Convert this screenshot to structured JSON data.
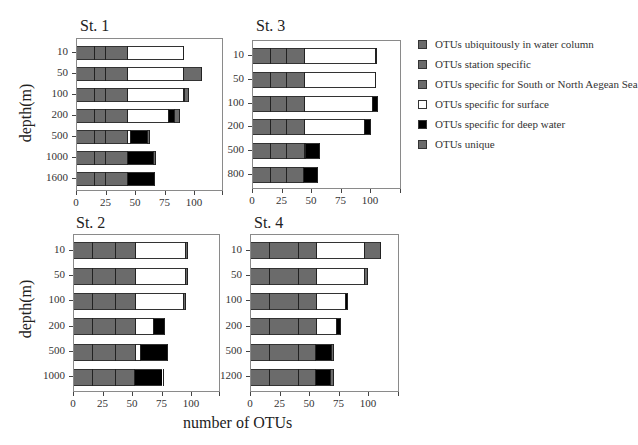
{
  "chart_data": {
    "type": "bar",
    "orientation": "horizontal",
    "stacked": true,
    "xlabel": "number of OTUs",
    "ylabel": "depth(m)",
    "xticks": [
      0,
      25,
      50,
      75,
      100
    ],
    "xlim": [
      0,
      125
    ],
    "legend_position": "right",
    "legend": [
      {
        "key": "ubiq",
        "label": "OTUs ubiquitously in water column",
        "color": "#6b6b6b"
      },
      {
        "key": "stn",
        "label": "OTUs station specific",
        "color": "#6b6b6b"
      },
      {
        "key": "sn",
        "label": "OTUs specific for South or North Aegean Sea",
        "color": "#6b6b6b"
      },
      {
        "key": "surface",
        "label": "OTUs specific for surface",
        "color": "#ffffff"
      },
      {
        "key": "deep",
        "label": "OTUs specific for deep water",
        "color": "#000000"
      },
      {
        "key": "unique",
        "label": "OTUs unique",
        "color": "#6b6b6b"
      }
    ],
    "panels": [
      {
        "title": "St. 1",
        "categories": [
          "10",
          "50",
          "100",
          "200",
          "500",
          "1000",
          "1600"
        ],
        "series": [
          {
            "name": "OTUs ubiquitously in water column",
            "values": [
              14,
              14,
              14,
              14,
              14,
              14,
              14
            ]
          },
          {
            "name": "OTUs station specific",
            "values": [
              10,
              10,
              10,
              10,
              10,
              10,
              10
            ]
          },
          {
            "name": "OTUs specific for South or North Aegean Sea",
            "values": [
              18,
              18,
              18,
              18,
              18,
              18,
              18
            ]
          },
          {
            "name": "OTUs specific for surface",
            "values": [
              48,
              48,
              48,
              35,
              3,
              0,
              0
            ]
          },
          {
            "name": "OTUs specific for deep water",
            "values": [
              0,
              0,
              1,
              5,
              14,
              22,
              23
            ]
          },
          {
            "name": "OTUs unique",
            "values": [
              1,
              16,
              4,
              5,
              3,
              3,
              1
            ]
          }
        ]
      },
      {
        "title": "St. 3",
        "categories": [
          "10",
          "50",
          "100",
          "200",
          "500",
          "800"
        ],
        "series": [
          {
            "name": "OTUs ubiquitously in water column",
            "values": [
              14,
              14,
              14,
              14,
              14,
              14
            ]
          },
          {
            "name": "OTUs station specific",
            "values": [
              14,
              14,
              14,
              14,
              14,
              14
            ]
          },
          {
            "name": "OTUs specific for South or North Aegean Sea",
            "values": [
              15,
              15,
              15,
              15,
              15,
              14
            ]
          },
          {
            "name": "OTUs specific for surface",
            "values": [
              60,
              60,
              58,
              51,
              1,
              0
            ]
          },
          {
            "name": "OTUs specific for deep water",
            "values": [
              0,
              0,
              5,
              5,
              13,
              13
            ]
          },
          {
            "name": "OTUs unique",
            "values": [
              2,
              1,
              0,
              1,
              0,
              0
            ]
          }
        ]
      },
      {
        "title": "St. 2",
        "categories": [
          "10",
          "50",
          "100",
          "200",
          "500",
          "1000"
        ],
        "series": [
          {
            "name": "OTUs ubiquitously in water column",
            "values": [
              15,
              15,
              15,
              15,
              15,
              15
            ]
          },
          {
            "name": "OTUs station specific",
            "values": [
              20,
              20,
              20,
              20,
              20,
              20
            ]
          },
          {
            "name": "OTUs specific for South or North Aegean Sea",
            "values": [
              17,
              17,
              17,
              17,
              17,
              16
            ]
          },
          {
            "name": "OTUs specific for surface",
            "values": [
              42,
              42,
              40,
              15,
              4,
              0
            ]
          },
          {
            "name": "OTUs specific for deep water",
            "values": [
              0,
              0,
              0,
              9,
              23,
              24
            ]
          },
          {
            "name": "OTUs unique",
            "values": [
              3,
              3,
              3,
              1,
              1,
              1
            ]
          }
        ]
      },
      {
        "title": "St. 4",
        "categories": [
          "10",
          "50",
          "100",
          "200",
          "500",
          "1200"
        ],
        "series": [
          {
            "name": "OTUs ubiquitously in water column",
            "values": [
              15,
              15,
              15,
              15,
              15,
              15
            ]
          },
          {
            "name": "OTUs station specific",
            "values": [
              25,
              25,
              25,
              25,
              25,
              25
            ]
          },
          {
            "name": "OTUs specific for South or North Aegean Sea",
            "values": [
              15,
              15,
              15,
              15,
              14,
              14
            ]
          },
          {
            "name": "OTUs specific for surface",
            "values": [
              41,
              41,
              25,
              17,
              0,
              0
            ]
          },
          {
            "name": "OTUs specific for deep water",
            "values": [
              0,
              0,
              1,
              4,
              14,
              13
            ]
          },
          {
            "name": "OTUs unique",
            "values": [
              14,
              3,
              1,
              0,
              2,
              3
            ]
          }
        ]
      }
    ]
  },
  "labels": {
    "x_axis_title": "number of OTUs",
    "y_axis_title": "depth(m)"
  }
}
